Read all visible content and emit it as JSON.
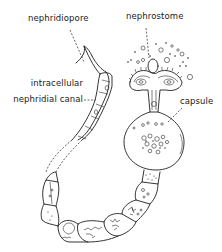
{
  "figure": {
    "labels": [
      {
        "id": "nephridiopore",
        "text": "nephridiopore"
      },
      {
        "id": "nephrostome",
        "text": "nephrostome"
      },
      {
        "id": "intracellular-canal-line1",
        "text": "intracellular"
      },
      {
        "id": "intracellular-canal-line2",
        "text": "nephridial canal"
      },
      {
        "id": "capsule",
        "text": "capsule"
      }
    ],
    "colors": {
      "ink": "#1f1f1f",
      "background": "#ffffff"
    }
  }
}
